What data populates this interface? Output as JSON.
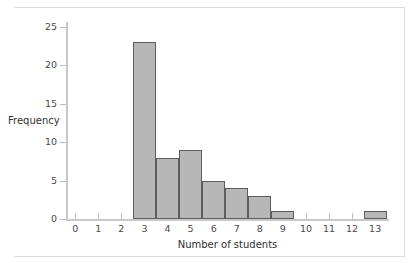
{
  "chart_data": {
    "type": "bar",
    "title": "",
    "xlabel": "Number of students",
    "ylabel": "Frequency",
    "categories": [
      "0",
      "1",
      "2",
      "3",
      "4",
      "5",
      "6",
      "7",
      "8",
      "9",
      "10",
      "11",
      "12",
      "13"
    ],
    "values": [
      0,
      0,
      0,
      23,
      8,
      9,
      5,
      4,
      3,
      1,
      0,
      0,
      0,
      1
    ],
    "x": [
      0,
      1,
      2,
      3,
      4,
      5,
      6,
      7,
      8,
      9,
      10,
      11,
      12,
      13
    ],
    "xlim": [
      -0.4,
      13.6
    ],
    "ylim": [
      0,
      26
    ],
    "xticks": [
      "0",
      "1",
      "2",
      "3",
      "4",
      "5",
      "6",
      "7",
      "8",
      "9",
      "10",
      "11",
      "12",
      "13"
    ],
    "yticks": [
      "0",
      "5",
      "10",
      "15",
      "20",
      "25"
    ],
    "ytick_values": [
      0,
      5,
      10,
      15,
      20,
      25
    ],
    "grid": false,
    "legend": false,
    "bar_width": 1,
    "bar_fill_color": "#b7b7b7",
    "bar_edge_color": "#5d5d5d",
    "axis_color": "#c6cacd",
    "background_color": "#ffffff"
  }
}
